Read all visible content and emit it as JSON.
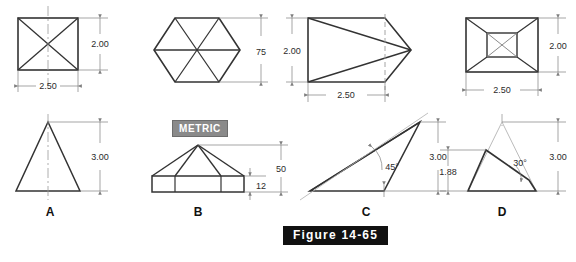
{
  "figure": {
    "caption": "Figure 14-65",
    "metric_badge": "METRIC"
  },
  "objects": [
    {
      "key": "A",
      "label": "A",
      "top_view": "square-with-diagonals",
      "front_view": "triangle",
      "dims": {
        "width": "2.50",
        "height_top": "2.00",
        "height_front": "3.00"
      }
    },
    {
      "key": "B",
      "label": "B",
      "top_view": "hexagon-six-triangles",
      "front_view": "hexagonal-pyramid-on-base",
      "dims": {
        "across": "75",
        "height_total": "50",
        "base_height": "12"
      }
    },
    {
      "key": "C",
      "label": "C",
      "top_view": "wedge-point-right",
      "front_view": "oblique-triangle",
      "dims": {
        "width": "2.50",
        "height_top": "2.00",
        "height_front": "3.00",
        "angle": "45°"
      }
    },
    {
      "key": "D",
      "label": "D",
      "top_view": "truncated-pyramid",
      "front_view": "truncated-triangle",
      "dims": {
        "width": "2.50",
        "height_top": "2.00",
        "height_front": "3.00",
        "cut_height": "1.88",
        "angle": "30°"
      }
    }
  ],
  "dimension_text": {
    "a_top_height": "2.00",
    "a_top_width": "2.50",
    "a_front_height": "3.00",
    "b_top_across": "75",
    "b_front_total": "50",
    "b_front_base": "12",
    "c_top_height": "2.00",
    "c_top_width": "2.50",
    "c_front_height": "3.00",
    "c_front_angle": "45°",
    "d_top_height": "2.00",
    "d_top_width": "2.50",
    "d_front_height": "3.00",
    "d_front_cut": "1.88",
    "d_front_angle": "30°"
  },
  "colors": {
    "line": "#333333",
    "dim": "#808080",
    "center": "#9a9a9a",
    "badge_metric_bg": "#8a8a8a",
    "badge_fig_bg": "#111111"
  }
}
